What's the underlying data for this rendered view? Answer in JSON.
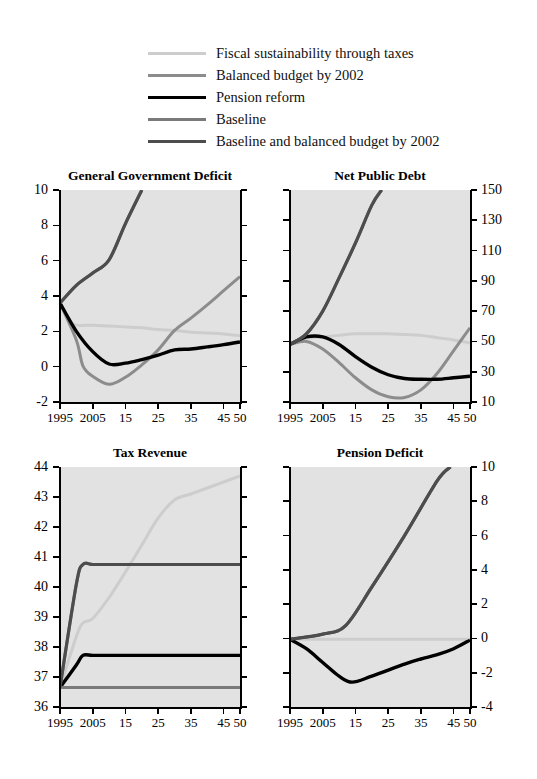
{
  "figure": {
    "background": "#ffffff",
    "plot_background": "#e2e2e2"
  },
  "legend": {
    "position": "top",
    "items": [
      {
        "label": "Fiscal sustainability through taxes",
        "color": "#cdcdcd",
        "width": 3.0,
        "key": "fiscal_sustainability_through_taxes"
      },
      {
        "label": "Balanced budget by 2002",
        "color": "#8c8c8c",
        "width": 3.0,
        "key": "balanced_budget_by_2002"
      },
      {
        "label": "Pension reform",
        "color": "#000000",
        "width": 3.4,
        "key": "pension_reform"
      },
      {
        "label": "Baseline",
        "color": "#7a7a7a",
        "width": 3.0,
        "key": "baseline"
      },
      {
        "label": "Baseline and balanced budget by 2002",
        "color": "#4d4d4d",
        "width": 3.2,
        "key": "baseline_and_balanced_budget_by_2002"
      }
    ]
  },
  "axis": {
    "xlim": [
      1995,
      2050
    ],
    "xticks": [
      1995,
      2005,
      2015,
      2025,
      2035,
      2045,
      2050
    ],
    "xtick_labels": [
      "1995",
      "2005",
      "15",
      "25",
      "35",
      "45",
      "50"
    ]
  },
  "chart_data": [
    {
      "id": "general-government-deficit",
      "type": "line",
      "title": "General Government Deficit",
      "xlabel": "",
      "ylabel": "",
      "xlim": [
        1995,
        2050
      ],
      "ylim": [
        -2,
        10
      ],
      "yticks": [
        -2,
        0,
        2,
        4,
        6,
        8,
        10
      ],
      "ytick_labels": [
        "-2",
        "0",
        "2",
        "4",
        "6",
        "8",
        "10"
      ],
      "yaxis_side": "left",
      "grid": false,
      "series": [
        {
          "name": "Fiscal sustainability through taxes",
          "color": "#cdcdcd",
          "x": [
            1995,
            1998,
            2000,
            2005,
            2010,
            2015,
            2020,
            2025,
            2030,
            2035,
            2040,
            2045,
            2050
          ],
          "y": [
            3.6,
            2.6,
            2.35,
            2.35,
            2.3,
            2.25,
            2.2,
            2.1,
            2.05,
            1.95,
            1.9,
            1.85,
            1.75
          ]
        },
        {
          "name": "Balanced budget by 2002",
          "color": "#8c8c8c",
          "x": [
            1995,
            2000,
            2002,
            2005,
            2010,
            2015,
            2020,
            2025,
            2030,
            2035,
            2040,
            2045,
            2050
          ],
          "y": [
            3.6,
            1.5,
            0.05,
            -0.55,
            -1.0,
            -0.6,
            0.1,
            0.95,
            2.05,
            2.75,
            3.5,
            4.3,
            5.1
          ]
        },
        {
          "name": "Pension reform",
          "color": "#000000",
          "x": [
            1995,
            2000,
            2005,
            2010,
            2015,
            2020,
            2025,
            2030,
            2035,
            2040,
            2045,
            2050
          ],
          "y": [
            3.6,
            2.0,
            0.85,
            0.15,
            0.2,
            0.4,
            0.65,
            0.95,
            1.0,
            1.12,
            1.25,
            1.4
          ]
        },
        {
          "name": "Baseline",
          "color": "#7a7a7a",
          "x": [
            1995,
            2000,
            2005,
            2010,
            2015,
            2020
          ],
          "y": [
            3.6,
            4.6,
            5.3,
            6.05,
            8.1,
            10.0
          ]
        },
        {
          "name": "Baseline and balanced budget by 2002",
          "color": "#4d4d4d",
          "x": [
            1995,
            2000,
            2005,
            2010,
            2015,
            2020
          ],
          "y": [
            3.6,
            4.6,
            5.3,
            6.05,
            8.1,
            10.0
          ]
        }
      ]
    },
    {
      "id": "net-public-debt",
      "type": "line",
      "title": "Net Public Debt",
      "xlabel": "",
      "ylabel": "",
      "xlim": [
        1995,
        2050
      ],
      "ylim": [
        10,
        150
      ],
      "yticks": [
        10,
        30,
        50,
        70,
        90,
        110,
        130,
        150
      ],
      "ytick_labels": [
        "10",
        "30",
        "50",
        "70",
        "90",
        "110",
        "130",
        "150"
      ],
      "yaxis_side": "right",
      "grid": false,
      "series": [
        {
          "name": "Fiscal sustainability through taxes",
          "color": "#cdcdcd",
          "x": [
            1995,
            2000,
            2005,
            2010,
            2015,
            2020,
            2025,
            2030,
            2035,
            2040,
            2045,
            2050
          ],
          "y": [
            48,
            52,
            53,
            54,
            55,
            55,
            55,
            54.5,
            54,
            52.5,
            51,
            49
          ]
        },
        {
          "name": "Balanced budget by 2002",
          "color": "#8c8c8c",
          "x": [
            1995,
            2000,
            2005,
            2010,
            2015,
            2020,
            2025,
            2030,
            2035,
            2040,
            2045,
            2050
          ],
          "y": [
            48,
            50,
            45,
            36,
            26,
            18,
            13.5,
            13,
            18,
            29,
            44,
            59
          ]
        },
        {
          "name": "Pension reform",
          "color": "#000000",
          "x": [
            1995,
            2000,
            2005,
            2010,
            2015,
            2020,
            2025,
            2030,
            2035,
            2040,
            2045,
            2050
          ],
          "y": [
            48,
            53,
            53,
            48,
            40,
            33,
            28,
            25.5,
            25,
            25,
            26,
            27
          ]
        },
        {
          "name": "Baseline",
          "color": "#7a7a7a",
          "x": [
            1995,
            2000,
            2005,
            2010,
            2015,
            2020,
            2023
          ],
          "y": [
            48,
            55,
            70,
            92,
            115,
            140,
            150
          ]
        },
        {
          "name": "Baseline and balanced budget by 2002",
          "color": "#4d4d4d",
          "x": [
            1995,
            2000,
            2005,
            2010,
            2015,
            2020,
            2023
          ],
          "y": [
            48,
            55,
            70,
            92,
            115,
            140,
            150
          ]
        }
      ]
    },
    {
      "id": "tax-revenue",
      "type": "line",
      "title": "Tax Revenue",
      "xlabel": "",
      "ylabel": "",
      "xlim": [
        1995,
        2050
      ],
      "ylim": [
        36,
        44
      ],
      "yticks": [
        36,
        37,
        38,
        39,
        40,
        41,
        42,
        43,
        44
      ],
      "ytick_labels": [
        "36",
        "37",
        "38",
        "39",
        "40",
        "41",
        "42",
        "43",
        "44"
      ],
      "yaxis_side": "left",
      "grid": false,
      "series": [
        {
          "name": "Fiscal sustainability through taxes",
          "color": "#cdcdcd",
          "x": [
            1995,
            2000,
            2002,
            2005,
            2010,
            2015,
            2020,
            2025,
            2030,
            2035,
            2040,
            2045,
            2050
          ],
          "y": [
            36.65,
            38.35,
            38.8,
            38.95,
            39.65,
            40.5,
            41.4,
            42.3,
            42.9,
            43.1,
            43.3,
            43.5,
            43.7
          ]
        },
        {
          "name": "Balanced budget by 2002",
          "color": "#8c8c8c",
          "x": [
            1995,
            2000,
            2002,
            2005,
            2010,
            2020,
            2030,
            2040,
            2050
          ],
          "y": [
            36.65,
            40.1,
            40.75,
            40.75,
            40.75,
            40.75,
            40.75,
            40.75,
            40.75
          ]
        },
        {
          "name": "Pension reform",
          "color": "#000000",
          "x": [
            1995,
            2000,
            2002,
            2005,
            2010,
            2020,
            2030,
            2040,
            2050
          ],
          "y": [
            36.65,
            37.4,
            37.72,
            37.72,
            37.72,
            37.72,
            37.72,
            37.72,
            37.72
          ]
        },
        {
          "name": "Baseline",
          "color": "#7a7a7a",
          "x": [
            1995,
            2000,
            2005,
            2010,
            2020,
            2030,
            2040,
            2050
          ],
          "y": [
            36.65,
            36.65,
            36.65,
            36.65,
            36.65,
            36.65,
            36.65,
            36.65
          ]
        },
        {
          "name": "Baseline and balanced budget by 2002",
          "color": "#4d4d4d",
          "x": [
            1995,
            2000,
            2002,
            2005,
            2010,
            2020,
            2030,
            2040,
            2050
          ],
          "y": [
            36.65,
            40.1,
            40.75,
            40.75,
            40.75,
            40.75,
            40.75,
            40.75,
            40.75
          ]
        }
      ]
    },
    {
      "id": "pension-deficit",
      "type": "line",
      "title": "Pension Deficit",
      "xlabel": "",
      "ylabel": "",
      "xlim": [
        1995,
        2050
      ],
      "ylim": [
        -4,
        10
      ],
      "yticks": [
        -4,
        -2,
        0,
        2,
        4,
        6,
        8,
        10
      ],
      "ytick_labels": [
        "-4",
        "-2",
        "0",
        "2",
        "4",
        "6",
        "8",
        "10"
      ],
      "yaxis_side": "right",
      "grid": false,
      "series": [
        {
          "name": "Fiscal sustainability through taxes",
          "color": "#cdcdcd",
          "x": [
            1995,
            2005,
            2015,
            2025,
            2035,
            2045,
            2050
          ],
          "y": [
            -0.05,
            -0.05,
            -0.05,
            -0.05,
            -0.05,
            -0.05,
            -0.05
          ]
        },
        {
          "name": "Balanced budget by 2002",
          "color": "#8c8c8c",
          "x": [
            1995,
            2005,
            2012,
            2020,
            2030,
            2040,
            2044
          ],
          "y": [
            -0.05,
            0.25,
            0.75,
            3.0,
            6.0,
            9.2,
            10.0
          ]
        },
        {
          "name": "Pension reform",
          "color": "#000000",
          "x": [
            1995,
            2000,
            2005,
            2010,
            2014,
            2020,
            2030,
            2035,
            2040,
            2045,
            2050
          ],
          "y": [
            -0.05,
            -0.6,
            -1.4,
            -2.2,
            -2.55,
            -2.2,
            -1.5,
            -1.2,
            -0.95,
            -0.6,
            -0.1
          ]
        },
        {
          "name": "Baseline",
          "color": "#7a7a7a",
          "x": [
            1995,
            2005,
            2012,
            2020,
            2030,
            2040,
            2044
          ],
          "y": [
            -0.05,
            0.25,
            0.75,
            3.0,
            6.0,
            9.2,
            10.0
          ]
        },
        {
          "name": "Baseline and balanced budget by 2002",
          "color": "#4d4d4d",
          "x": [
            1995,
            2005,
            2012,
            2020,
            2030,
            2040,
            2044
          ],
          "y": [
            -0.05,
            0.25,
            0.75,
            3.0,
            6.0,
            9.2,
            10.0
          ]
        }
      ]
    }
  ]
}
